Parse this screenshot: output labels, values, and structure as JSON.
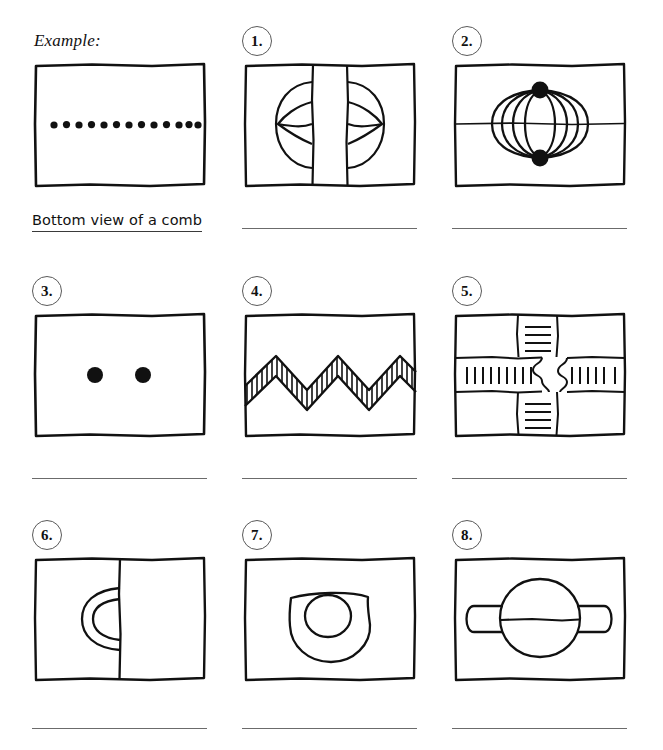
{
  "page": {
    "kind": "visual-puzzle-worksheet",
    "background_color": "#ffffff",
    "ink_color": "#111111",
    "rule_color": "#6b6b6b"
  },
  "example": {
    "label": "Example:",
    "caption": "Bottom view of a comb",
    "figure": {
      "name": "row-of-dots",
      "description": "rectangle containing a single horizontal row of filled dots",
      "dot_count": 13
    }
  },
  "puzzles": [
    {
      "number": "1.",
      "badge_label": "1.",
      "answer": "",
      "figure": {
        "name": "split-circle-with-lenses",
        "description": "circle bisected by two vertical lines with lens shapes in each half"
      }
    },
    {
      "number": "2.",
      "badge_label": "2.",
      "answer": "",
      "figure": {
        "name": "globe-meridians-with-poles",
        "description": "lantern/globe of meridian arcs between two black dots, crossed by a horizontal line"
      }
    },
    {
      "number": "3.",
      "badge_label": "3.",
      "answer": "",
      "figure": {
        "name": "two-dots",
        "description": "empty rectangle with two filled dots side by side"
      }
    },
    {
      "number": "4.",
      "badge_label": "4.",
      "answer": "",
      "figure": {
        "name": "hatched-zigzag-band",
        "description": "horizontal zigzag band filled with close hatch lines"
      }
    },
    {
      "number": "5.",
      "badge_label": "5.",
      "answer": "",
      "figure": {
        "name": "interlocking-cross-bands",
        "description": "vertical and horizontal bands meeting in a puzzle-piece interlock, with tick hatching"
      }
    },
    {
      "number": "6.",
      "badge_label": "6.",
      "answer": "",
      "figure": {
        "name": "double-arc-at-vertical-line",
        "description": "two concentric semicircular arcs bulging left from a vertical line"
      }
    },
    {
      "number": "7.",
      "badge_label": "7.",
      "answer": "",
      "figure": {
        "name": "blob-with-small-circle",
        "description": "rounded blob outline containing a small circle set high and left"
      }
    },
    {
      "number": "8.",
      "badge_label": "8.",
      "answer": "",
      "figure": {
        "name": "circle-with-side-bars",
        "description": "circle split by a horizontal line with rounded bars extending left and right"
      }
    }
  ]
}
